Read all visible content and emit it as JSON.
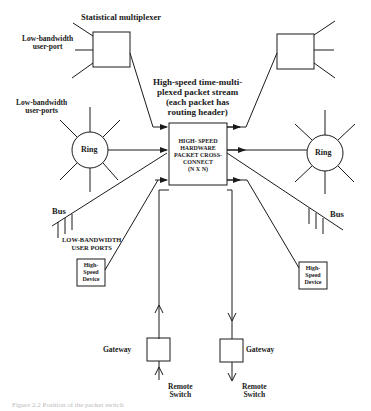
{
  "diagram": {
    "labels": {
      "stat_mux": "Statistical multiplexer",
      "low_bw_user_port": [
        "Low-bandwidth",
        "user-port"
      ],
      "low_bw_user_ports": [
        "Low-bandwidth",
        "user-ports"
      ],
      "packet_stream": [
        "High-speed time-multi-",
        "plexed packet stream",
        "(each packet has",
        "routing header)"
      ],
      "cross_connect": [
        "HIGH- SPEED",
        "HARDWARE",
        "PACKET CROSS-",
        "CONNECT",
        "(N X N)"
      ],
      "ring_left": "Ring",
      "ring_right": "Ring",
      "bus_left": "Bus",
      "bus_right": "Bus",
      "low_bw_user_ports_caps": [
        "LOW-BANDWIDTH",
        "USER PORTS"
      ],
      "hs_device_left": [
        "High-",
        "Speed",
        "Device"
      ],
      "hs_device_right": [
        "High-",
        "Speed",
        "Device"
      ],
      "gateway_left": "Gateway",
      "gateway_right": "Gateway",
      "remote_switch_left": [
        "Remote",
        "Switch"
      ],
      "remote_switch_right": [
        "Remote",
        "Switch"
      ]
    },
    "caption": "Figure 2.2  Position of the packet switch",
    "colors": {
      "ink": "#1a1a1a",
      "background": "#ffffff"
    }
  }
}
